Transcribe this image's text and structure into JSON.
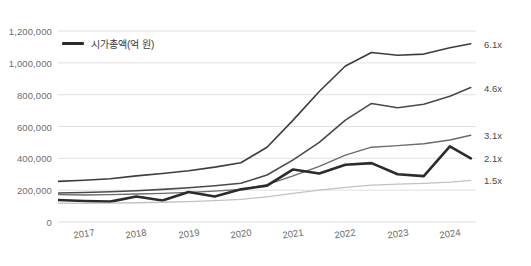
{
  "legend": {
    "label": "시가총액(억 원)",
    "swatch_color": "#2b2b2b",
    "position": "inside-top-left"
  },
  "axis": {
    "y_ticks": [
      "0",
      "200,000",
      "400,000",
      "600,000",
      "800,000",
      "1,000,000",
      "1,200,000"
    ],
    "x_ticks": [
      "2017",
      "2018",
      "2019",
      "2020",
      "2021",
      "2022",
      "2023",
      "2024"
    ]
  },
  "end_labels": [
    {
      "text": "6.1x",
      "value_series": "6.1x"
    },
    {
      "text": "4.6x",
      "value_series": "4.6x"
    },
    {
      "text": "3.1x",
      "value_series": "3.1x"
    },
    {
      "text": "2.1x",
      "value_series": "2.1x"
    },
    {
      "text": "1.5x",
      "value_series": "1.5x"
    }
  ],
  "colors": {
    "grid": "#dcdcdc",
    "axis_text": "#6e6e6e",
    "series_bold": "#2b2b2b",
    "series_dark": "#3d3d3d",
    "series_mid": "#5a5a5a",
    "series_light": "#8d8d8d",
    "series_lighter": "#bfbfbf",
    "background": "#ffffff"
  },
  "chart_data": {
    "type": "line",
    "title": "",
    "subtitle": "",
    "xlabel": "",
    "ylabel": "",
    "ylim": [
      0,
      1200000
    ],
    "xlim": [
      2016.5,
      2024.5
    ],
    "grid": true,
    "legend_position": "inside-top-left",
    "y_tick_values": [
      0,
      200000,
      400000,
      600000,
      800000,
      1000000,
      1200000
    ],
    "x_tick_values": [
      2017,
      2018,
      2019,
      2020,
      2021,
      2022,
      2023,
      2024
    ],
    "x": [
      2016.5,
      2017,
      2017.5,
      2018,
      2018.5,
      2019,
      2019.5,
      2020,
      2020.5,
      2021,
      2021.5,
      2022,
      2022.5,
      2023,
      2023.5,
      2024,
      2024.4
    ],
    "series": [
      {
        "name": "6.1x",
        "end_label": "6.1x",
        "color": "#3d3d3d",
        "width": 1.6,
        "values": [
          255000,
          262000,
          272000,
          290000,
          305000,
          322000,
          345000,
          372000,
          470000,
          640000,
          820000,
          980000,
          1065000,
          1048000,
          1055000,
          1095000,
          1120000
        ]
      },
      {
        "name": "4.6x",
        "end_label": "4.6x",
        "color": "#4a4a4a",
        "width": 1.6,
        "values": [
          182000,
          185000,
          190000,
          196000,
          205000,
          215000,
          228000,
          243000,
          295000,
          390000,
          500000,
          640000,
          745000,
          718000,
          740000,
          790000,
          845000
        ]
      },
      {
        "name": "3.1x",
        "end_label": "3.1x",
        "color": "#6b6b6b",
        "width": 1.4,
        "values": [
          172000,
          170000,
          172000,
          176000,
          180000,
          186000,
          194000,
          205000,
          235000,
          290000,
          350000,
          420000,
          470000,
          480000,
          492000,
          515000,
          545000
        ]
      },
      {
        "name": "2.1x",
        "end_label": "2.1x",
        "color": "#2b2b2b",
        "width": 2.6,
        "values": [
          138000,
          132000,
          128000,
          160000,
          135000,
          188000,
          160000,
          205000,
          228000,
          330000,
          305000,
          360000,
          370000,
          300000,
          288000,
          345000,
          400000
        ]
      },
      {
        "name": "1.5x",
        "end_label": "1.5x",
        "color": "#c2c2c2",
        "width": 1.3,
        "values": [
          118000,
          117000,
          118000,
          121000,
          124000,
          128000,
          134000,
          142000,
          158000,
          180000,
          200000,
          218000,
          232000,
          238000,
          243000,
          250000,
          262000
        ]
      }
    ],
    "annotations": [
      {
        "text": "2.1x series spikes to 475,000 at 2024 then falls to 400,000",
        "x": 2024,
        "y": 475000
      }
    ],
    "bold_series_spike": {
      "x": 2024,
      "value": 475000
    }
  }
}
